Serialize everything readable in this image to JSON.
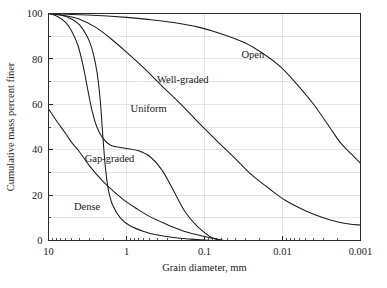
{
  "chart_data": {
    "type": "line",
    "title": "",
    "xlabel": "Grain diameter, mm",
    "ylabel": "Cumulative mass percent finer",
    "x_scale": "log",
    "x_reversed": true,
    "xlim": [
      10,
      0.001
    ],
    "ylim": [
      0,
      100
    ],
    "grid": true,
    "legend_position": "inline-curve-labels",
    "x_tick_labels": [
      "10",
      "1",
      "0.1",
      "0.01",
      "0.001"
    ],
    "x_tick_values": [
      10,
      1,
      0.1,
      0.01,
      0.001
    ],
    "y_tick_labels": [
      "0",
      "20",
      "40",
      "60",
      "80",
      "100"
    ],
    "y_tick_values": [
      0,
      20,
      40,
      60,
      80,
      100
    ],
    "y_minor_ticks": [
      10,
      30,
      50,
      70,
      90
    ],
    "series": [
      {
        "name": "Dense",
        "label": "Dense",
        "label_x": 3.2,
        "label_y": 15,
        "x": [
          10,
          8,
          6,
          5,
          4,
          3,
          2,
          1.5,
          1,
          0.7,
          0.5,
          0.35,
          0.25,
          0.18,
          0.12,
          0.09,
          0.07,
          0.055
        ],
        "y": [
          58,
          53,
          47,
          43,
          39,
          33,
          26,
          22,
          17,
          13.5,
          10.5,
          8,
          5.8,
          4,
          2.4,
          1.4,
          0.6,
          0
        ]
      },
      {
        "name": "Gap-graded",
        "label": "Gap-graded",
        "label_x": 1.65,
        "label_y": 36,
        "x": [
          10,
          8,
          6,
          5,
          4.2,
          3.6,
          3.2,
          2.8,
          2.4,
          2.0,
          1.6,
          1.2,
          1.0,
          0.7,
          0.5,
          0.35,
          0.25,
          0.18,
          0.13,
          0.1,
          0.08,
          0.06
        ],
        "y": [
          100,
          99,
          96,
          92,
          86,
          77,
          68,
          58,
          50,
          45,
          42,
          41,
          40.5,
          39.5,
          37,
          31,
          22,
          13,
          7,
          3.5,
          1.2,
          0
        ]
      },
      {
        "name": "Uniform",
        "label": "Uniform",
        "label_x": 0.52,
        "label_y": 58,
        "x": [
          10,
          7,
          5,
          4,
          3.2,
          2.8,
          2.5,
          2.3,
          2.15,
          2.05,
          1.95,
          1.85,
          1.7,
          1.5,
          1.2,
          0.9,
          0.6,
          0.4,
          0.25,
          0.15,
          0.1,
          0.07
        ],
        "y": [
          100,
          99.3,
          97.5,
          95,
          90,
          85,
          78,
          70,
          60,
          50,
          40,
          31,
          22,
          15.5,
          10,
          6.5,
          4,
          2.4,
          1.3,
          0.6,
          0.2,
          0
        ]
      },
      {
        "name": "Well-graded",
        "label": "Well-graded",
        "label_x": 0.19,
        "label_y": 71,
        "x": [
          10,
          6,
          4,
          2.5,
          1.6,
          1.0,
          0.6,
          0.35,
          0.2,
          0.12,
          0.07,
          0.04,
          0.025,
          0.015,
          0.009,
          0.005,
          0.003,
          0.002,
          0.0014,
          0.001
        ],
        "y": [
          100,
          99,
          97.5,
          94,
          89,
          83,
          76,
          68,
          60,
          52,
          44,
          36,
          29,
          23,
          17.5,
          13,
          10,
          8.3,
          7.3,
          6.8
        ]
      },
      {
        "name": "Open",
        "label": "Open",
        "label_x": 0.024,
        "label_y": 82,
        "x": [
          10,
          5,
          2,
          1.0,
          0.5,
          0.25,
          0.12,
          0.06,
          0.03,
          0.018,
          0.011,
          0.007,
          0.004,
          0.0025,
          0.0018,
          0.0013,
          0.001
        ],
        "y": [
          100,
          99.6,
          99,
          98.3,
          97.3,
          96,
          94,
          91,
          87,
          82.5,
          77,
          70,
          60,
          50,
          43,
          38,
          34
        ]
      }
    ]
  }
}
